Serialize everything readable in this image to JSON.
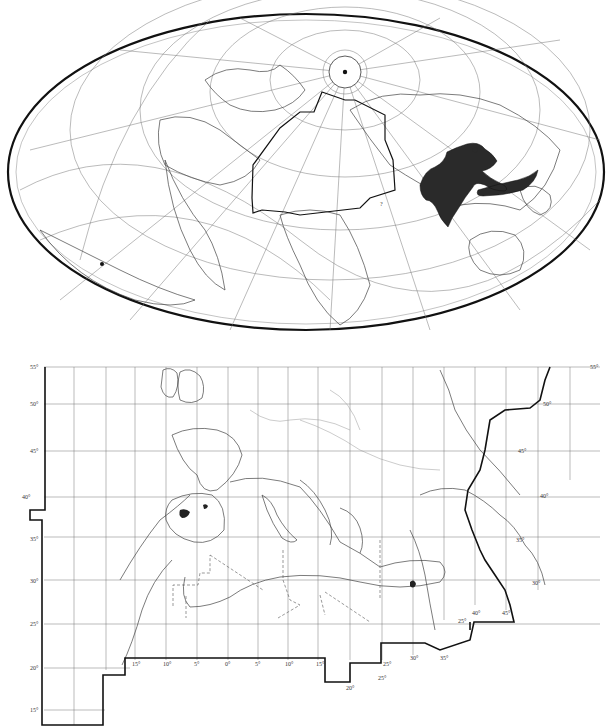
{
  "figure": {
    "world_map": {
      "projection": "oblique elliptical (Hammer-type) world map",
      "highlight_outline": "study-area polygon over Europe, North Africa and Middle East",
      "distribution_fill_color": "#2a2a2a",
      "distribution_region": "South and Southeast Asia (India to Indonesia)",
      "pole_marker": "filled dot at north pole circle",
      "secondary_marker": "filled dot in South America (lower left)",
      "question_mark_label": "?"
    },
    "regional_map": {
      "latitude_labels_left": [
        "55°",
        "50°",
        "45°",
        "40°",
        "35°",
        "30°",
        "25°",
        "20°",
        "15°"
      ],
      "latitude_labels_right": [
        "55°",
        "50°",
        "45°",
        "40°",
        "35°",
        "30°",
        "25°"
      ],
      "longitude_labels_bottom": [
        "15°",
        "10°",
        "5°",
        "0°",
        "5°",
        "10°",
        "15°",
        "20°",
        "25°",
        "30°",
        "35°"
      ],
      "longitude_labels_middle_east": [
        "40°",
        "45°"
      ],
      "misc_labels": [
        "20°",
        "25°",
        "30°"
      ],
      "border_style": "dashed international borders, thick study-area frame"
    }
  }
}
